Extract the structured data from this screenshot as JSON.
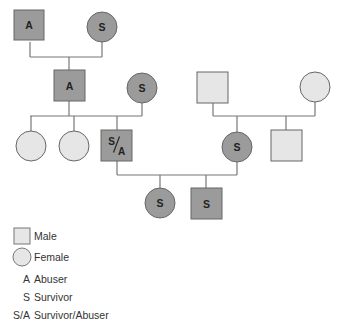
{
  "colors": {
    "affected_fill": "#9b9b9b",
    "unaffected_fill": "#e6e6e6",
    "stroke": "#666666",
    "line": "#777777",
    "text": "#222222"
  },
  "nodes": [
    {
      "id": "gen1-male",
      "shape": "square",
      "x": 14,
      "y": 10,
      "size": 30,
      "label": "A",
      "affected": true
    },
    {
      "id": "gen1-female",
      "shape": "circle",
      "cx": 102,
      "cy": 27,
      "r": 15,
      "label": "S",
      "affected": true
    },
    {
      "id": "gen2-male",
      "shape": "square",
      "x": 54,
      "y": 70,
      "size": 31,
      "label": "A",
      "affected": true
    },
    {
      "id": "gen2-female-spouse",
      "shape": "circle",
      "cx": 142,
      "cy": 88,
      "r": 15,
      "label": "S",
      "affected": true
    },
    {
      "id": "gen2-right-male",
      "shape": "square",
      "x": 197,
      "y": 72,
      "size": 31,
      "label": "",
      "affected": false
    },
    {
      "id": "gen2-right-female",
      "shape": "circle",
      "cx": 315,
      "cy": 87,
      "r": 15,
      "label": "",
      "affected": false
    },
    {
      "id": "gen3-female-1",
      "shape": "circle",
      "cx": 31,
      "cy": 146,
      "r": 15,
      "label": "",
      "affected": false
    },
    {
      "id": "gen3-female-2",
      "shape": "circle",
      "cx": 74,
      "cy": 146,
      "r": 15,
      "label": "",
      "affected": false
    },
    {
      "id": "gen3-male-sa",
      "shape": "square",
      "x": 101,
      "y": 130,
      "size": 31,
      "label": "S/A",
      "affected": true
    },
    {
      "id": "gen3-female-s",
      "shape": "circle",
      "cx": 237,
      "cy": 147,
      "r": 15,
      "label": "S",
      "affected": true
    },
    {
      "id": "gen3-right-male",
      "shape": "square",
      "x": 271,
      "y": 130,
      "size": 31,
      "label": "",
      "affected": false
    },
    {
      "id": "gen4-female",
      "shape": "circle",
      "cx": 160,
      "cy": 203,
      "r": 15,
      "label": "S",
      "affected": true
    },
    {
      "id": "gen4-male",
      "shape": "square",
      "x": 191,
      "y": 188,
      "size": 31,
      "label": "S",
      "affected": true
    }
  ],
  "lines": [
    {
      "x1": 30,
      "y1": 42,
      "x2": 30,
      "y2": 57
    },
    {
      "x1": 102,
      "y1": 42,
      "x2": 102,
      "y2": 57
    },
    {
      "x1": 30,
      "y1": 57,
      "x2": 102,
      "y2": 57
    },
    {
      "x1": 69,
      "y1": 57,
      "x2": 69,
      "y2": 70
    },
    {
      "x1": 69,
      "y1": 101,
      "x2": 69,
      "y2": 116
    },
    {
      "x1": 142,
      "y1": 103,
      "x2": 142,
      "y2": 116
    },
    {
      "x1": 30,
      "y1": 116,
      "x2": 142,
      "y2": 116
    },
    {
      "x1": 31,
      "y1": 116,
      "x2": 31,
      "y2": 131
    },
    {
      "x1": 74,
      "y1": 116,
      "x2": 74,
      "y2": 131
    },
    {
      "x1": 117,
      "y1": 116,
      "x2": 117,
      "y2": 130
    },
    {
      "x1": 213,
      "y1": 103,
      "x2": 213,
      "y2": 116
    },
    {
      "x1": 315,
      "y1": 102,
      "x2": 315,
      "y2": 116
    },
    {
      "x1": 213,
      "y1": 116,
      "x2": 315,
      "y2": 116
    },
    {
      "x1": 237,
      "y1": 116,
      "x2": 237,
      "y2": 132
    },
    {
      "x1": 286,
      "y1": 116,
      "x2": 286,
      "y2": 130
    },
    {
      "x1": 117,
      "y1": 161,
      "x2": 117,
      "y2": 175
    },
    {
      "x1": 237,
      "y1": 162,
      "x2": 237,
      "y2": 175
    },
    {
      "x1": 117,
      "y1": 175,
      "x2": 237,
      "y2": 175
    },
    {
      "x1": 160,
      "y1": 175,
      "x2": 160,
      "y2": 188
    },
    {
      "x1": 206,
      "y1": 175,
      "x2": 206,
      "y2": 188
    }
  ],
  "legend": {
    "items": [
      {
        "symbol_type": "square",
        "label": "Male"
      },
      {
        "symbol_type": "circle",
        "label": "Female"
      },
      {
        "symbol": "A",
        "label": "Abuser"
      },
      {
        "symbol": "S",
        "label": "Survivor"
      },
      {
        "symbol": "S/A",
        "label": "Survivor/Abuser"
      }
    ]
  }
}
